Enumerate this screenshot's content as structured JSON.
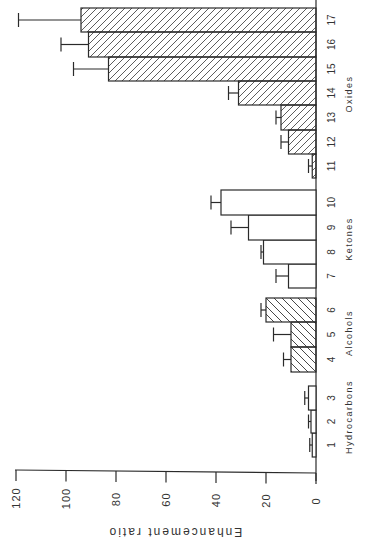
{
  "chart_data": {
    "type": "bar",
    "orientation": "rotated -90deg (bars extend leftward from baseline)",
    "title": "",
    "xlabel": "",
    "ylabel": "Enhancement ratio",
    "ylim": [
      0,
      120
    ],
    "yticks": [
      0,
      20,
      40,
      60,
      80,
      100,
      120
    ],
    "ytick_labels": [
      "0",
      "20",
      "40",
      "60",
      "80",
      "100",
      "120"
    ],
    "grid": false,
    "legend": null,
    "categories": [
      "1",
      "2",
      "3",
      "4",
      "5",
      "6",
      "7",
      "8",
      "9",
      "10",
      "11",
      "12",
      "13",
      "14",
      "15",
      "16",
      "17"
    ],
    "groups": [
      {
        "name": "Hydrocarbons",
        "categories": [
          "1",
          "2",
          "3"
        ],
        "pattern": "none"
      },
      {
        "name": "Alcohols",
        "categories": [
          "4",
          "5",
          "6"
        ],
        "pattern": "hatch-backslash"
      },
      {
        "name": "Ketones",
        "categories": [
          "7",
          "8",
          "9",
          "10"
        ],
        "pattern": "none"
      },
      {
        "name": "Oxides",
        "categories": [
          "11",
          "12",
          "13",
          "14",
          "15",
          "16",
          "17"
        ],
        "pattern": "hatch-forward"
      }
    ],
    "values": [
      1.5,
      2,
      3,
      10,
      10,
      20,
      11,
      21,
      27,
      38,
      1.5,
      11,
      14,
      31,
      83,
      91,
      94
    ],
    "error_upper": [
      2.5,
      3,
      4.5,
      13,
      17,
      22,
      16,
      22,
      34,
      42,
      3,
      14,
      16,
      35,
      97,
      102,
      119
    ]
  },
  "axis": {
    "title": "Enhancement ratio",
    "ticks": [
      "0",
      "20",
      "40",
      "60",
      "80",
      "100",
      "120"
    ]
  }
}
